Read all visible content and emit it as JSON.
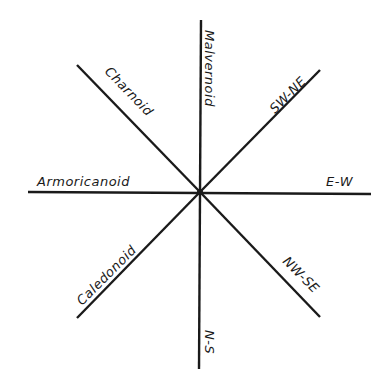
{
  "diagram": {
    "type": "orientation-rose",
    "center": [
      200,
      192
    ],
    "line_color": "#1a1a1a",
    "lines": [
      {
        "id": "vertical",
        "orientation": "N-S",
        "from": [
          201,
          20
        ],
        "to": [
          199,
          369
        ]
      },
      {
        "id": "horizontal",
        "orientation": "E-W",
        "from": [
          28,
          192
        ],
        "to": [
          371,
          194
        ]
      },
      {
        "id": "diag-nw",
        "orientation": "NW-SE (upper)",
        "from": [
          77,
          65
        ],
        "to": [
          200,
          192
        ]
      },
      {
        "id": "diag-ne",
        "orientation": "SW-NE (upper)",
        "from": [
          320,
          70
        ],
        "to": [
          200,
          192
        ]
      },
      {
        "id": "diag-sw",
        "orientation": "SW-NE (lower)",
        "from": [
          77,
          318
        ],
        "to": [
          200,
          192
        ]
      },
      {
        "id": "diag-se",
        "orientation": "NW-SE (lower)",
        "from": [
          320,
          317
        ],
        "to": [
          200,
          192
        ]
      }
    ],
    "labels": {
      "malvernoid": "Malvernoid",
      "charnoid": "Charnoid",
      "sw_ne": "SW-NE",
      "armoricanoid": "Armoricanoid",
      "e_w": "E-W",
      "caledonoid": "Caledonoid",
      "nw_se": "NW-SE",
      "n_s": "N-S"
    }
  }
}
